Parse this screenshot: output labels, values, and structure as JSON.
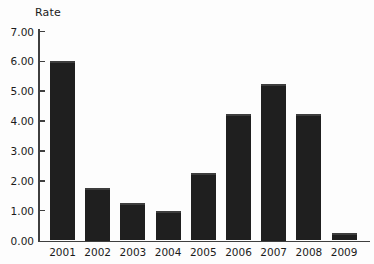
{
  "chart_data": {
    "type": "bar",
    "title": "Rate",
    "ylabel": "Rate",
    "xlabel": "",
    "categories": [
      "2001",
      "2002",
      "2003",
      "2004",
      "2005",
      "2006",
      "2007",
      "2008",
      "2009"
    ],
    "values": [
      6.0,
      1.75,
      1.25,
      1.0,
      2.25,
      4.25,
      5.25,
      4.25,
      0.25
    ],
    "ylim": [
      0,
      7
    ],
    "yticks": [
      0,
      1,
      2,
      3,
      4,
      5,
      6,
      7
    ],
    "ytick_labels": [
      "0.00",
      "1.00",
      "2.00",
      "3.00",
      "4.00",
      "5.00",
      "6.00",
      "7.00"
    ],
    "grid": false,
    "legend": null,
    "colors": {
      "bar_fill": "#1f1f1f",
      "bar_top_edge": "#3d3d3d",
      "axis": "#3f3f3f",
      "text": "#1b1b1b",
      "background": "#fdfdfd"
    }
  }
}
